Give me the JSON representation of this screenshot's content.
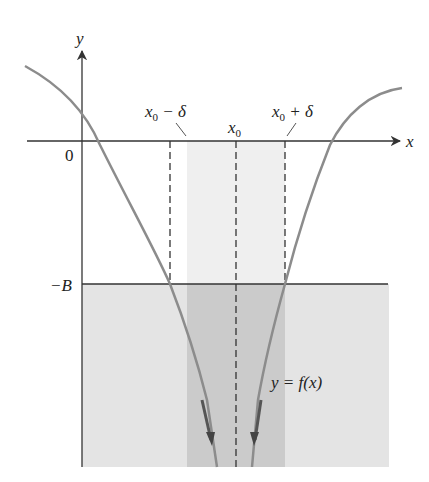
{
  "figure": {
    "type": "limit-diagram",
    "axes": {
      "x_label": "x",
      "y_label": "y",
      "origin_label": "0"
    },
    "labels": {
      "left_delta": "x0 − δ",
      "left_delta_base": "x",
      "left_delta_sub": "0",
      "left_delta_rest": " − δ",
      "center": "x0",
      "center_base": "x",
      "center_sub": "0",
      "right_delta": "x0 + δ",
      "right_delta_base": "x",
      "right_delta_sub": "0",
      "right_delta_rest": " + δ",
      "bound": "−B",
      "function": "y = f(x)"
    },
    "colors": {
      "curve": "#8a8a8a",
      "axis": "#333333",
      "band": "#ededed",
      "lower_region": "#e2e2e2",
      "overlap": "#c9c9c9",
      "dashed": "#333333"
    }
  }
}
